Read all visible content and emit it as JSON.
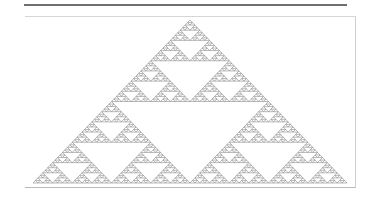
{
  "figure": {
    "depth": 6,
    "stroke_color": "#8a8a8a",
    "apex": [
      190,
      20
    ],
    "base_left": [
      33,
      183
    ],
    "base_right": [
      347,
      183
    ]
  },
  "colors": {
    "top_rule": "#6f6f6f",
    "frame_border": "#cfcfcf",
    "background": "#ffffff"
  }
}
